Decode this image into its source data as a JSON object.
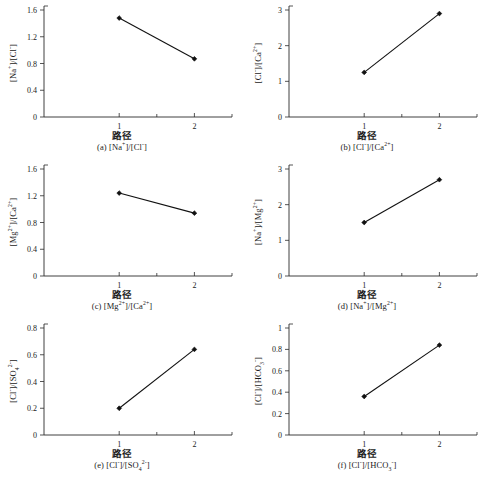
{
  "figure": {
    "background": "#ffffff",
    "ink_color": "#1a1a1a",
    "line_color": "#111111",
    "xlabel_cn": "路径",
    "x_categories": [
      "1",
      "2"
    ]
  },
  "chart_data": [
    {
      "id": "a",
      "type": "line",
      "title": "(a) [Na⁺]/[Cl⁻]",
      "caption_prefix": "(a)",
      "ylabel_html": "[Na<sup>+</sup>]/[Cl<sup>-</sup>]",
      "ylabel_text": "[Na+]/[Cl-]",
      "xlabel": "路径",
      "categories": [
        "1",
        "2"
      ],
      "x": [
        1,
        2
      ],
      "values": [
        1.48,
        0.87
      ],
      "ylim": [
        0,
        1.6
      ],
      "xlim": [
        0,
        2.5
      ],
      "yticks": [
        0,
        0.4,
        0.8,
        1.2,
        1.6
      ],
      "ytick_labels": [
        "0",
        "0.4",
        "0.8",
        "1.2",
        "1.6"
      ],
      "xticks": [
        1,
        2
      ],
      "xtick_labels": [
        "1",
        "2"
      ],
      "grid": false,
      "legend": "none",
      "marker": "filled-diamond"
    },
    {
      "id": "b",
      "type": "line",
      "title": "(b) [Cl⁻]/[Ca²⁺]",
      "caption_prefix": "(b)",
      "ylabel_html": "[Cl<sup>-</sup>]/[Ca<sup>2+</sup>]",
      "ylabel_text": "[Cl-]/[Ca2+]",
      "xlabel": "路径",
      "categories": [
        "1",
        "2"
      ],
      "x": [
        1,
        2
      ],
      "values": [
        1.25,
        2.9
      ],
      "ylim": [
        0,
        3
      ],
      "xlim": [
        0,
        2.5
      ],
      "yticks": [
        0,
        1,
        2,
        3
      ],
      "ytick_labels": [
        "0",
        "1",
        "2",
        "3"
      ],
      "xticks": [
        1,
        2
      ],
      "xtick_labels": [
        "1",
        "2"
      ],
      "grid": false,
      "legend": "none",
      "marker": "filled-diamond"
    },
    {
      "id": "c",
      "type": "line",
      "title": "(c) [Mg²⁺]/[Ca²⁺]",
      "caption_prefix": "(c)",
      "ylabel_html": "[Mg<sup>2+</sup>]/[Ca<sup>2+</sup>]",
      "ylabel_text": "[Mg2+]/[Ca2+]",
      "xlabel": "路径",
      "categories": [
        "1",
        "2"
      ],
      "x": [
        1,
        2
      ],
      "values": [
        1.24,
        0.94
      ],
      "ylim": [
        0,
        1.6
      ],
      "xlim": [
        0,
        2.5
      ],
      "yticks": [
        0,
        0.4,
        0.8,
        1.2,
        1.6
      ],
      "ytick_labels": [
        "0",
        "0.4",
        "0.8",
        "1.2",
        "1.6"
      ],
      "xticks": [
        1,
        2
      ],
      "xtick_labels": [
        "1",
        "2"
      ],
      "grid": false,
      "legend": "none",
      "marker": "filled-diamond"
    },
    {
      "id": "d",
      "type": "line",
      "title": "(d) [Na⁺]/[Mg²⁺]",
      "caption_prefix": "(d)",
      "ylabel_html": "[Na<sup>+</sup>]/[Mg<sup>2+</sup>]",
      "ylabel_text": "[Na+]/[Mg2+]",
      "xlabel": "路径",
      "categories": [
        "1",
        "2"
      ],
      "x": [
        1,
        2
      ],
      "values": [
        1.5,
        2.7
      ],
      "ylim": [
        0,
        3
      ],
      "xlim": [
        0,
        2.5
      ],
      "yticks": [
        0,
        1,
        2,
        3
      ],
      "ytick_labels": [
        "0",
        "1",
        "2",
        "3"
      ],
      "xticks": [
        1,
        2
      ],
      "xtick_labels": [
        "1",
        "2"
      ],
      "grid": false,
      "legend": "none",
      "marker": "filled-diamond"
    },
    {
      "id": "e",
      "type": "line",
      "title": "(e) [Cl⁻]/[SO₄²⁻]",
      "caption_prefix": "(e)",
      "ylabel_html": "[Cl<sup>-</sup>]/[SO<sub>4</sub><sup>2-</sup>]",
      "ylabel_text": "[Cl-]/[SO4 2-]",
      "xlabel": "路径",
      "categories": [
        "1",
        "2"
      ],
      "x": [
        1,
        2
      ],
      "values": [
        0.2,
        0.64
      ],
      "ylim": [
        0,
        0.8
      ],
      "xlim": [
        0,
        2.5
      ],
      "yticks": [
        0,
        0.2,
        0.4,
        0.6,
        0.8
      ],
      "ytick_labels": [
        "0",
        "0.2",
        "0.4",
        "0.6",
        "0.8"
      ],
      "xticks": [
        1,
        2
      ],
      "xtick_labels": [
        "1",
        "2"
      ],
      "grid": false,
      "legend": "none",
      "marker": "filled-diamond"
    },
    {
      "id": "f",
      "type": "line",
      "title": "(f) [Cl⁻]/[HCO₃⁻]",
      "caption_prefix": "(f)",
      "ylabel_html": "[Cl<sup>-</sup>]/[HCO<sub>3</sub><sup>-</sup>]",
      "ylabel_text": "[Cl-]/[HCO3-]",
      "xlabel": "路径",
      "categories": [
        "1",
        "2"
      ],
      "x": [
        1,
        2
      ],
      "values": [
        0.36,
        0.84
      ],
      "ylim": [
        0,
        1
      ],
      "xlim": [
        0,
        2.5
      ],
      "yticks": [
        0,
        0.2,
        0.4,
        0.6,
        0.8,
        1
      ],
      "ytick_labels": [
        "0",
        "0.2",
        "0.4",
        "0.6",
        "0.8",
        "1"
      ],
      "xticks": [
        1,
        2
      ],
      "xtick_labels": [
        "1",
        "2"
      ],
      "grid": false,
      "legend": "none",
      "marker": "filled-diamond"
    }
  ]
}
